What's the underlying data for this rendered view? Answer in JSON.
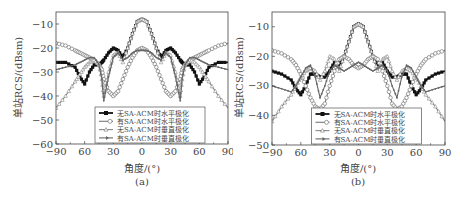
{
  "chart_data": [
    {
      "type": "line",
      "panel": "a",
      "caption": "(a)",
      "xlabel": "角度/(°)",
      "ylabel": "单站RCS/(dBsm)",
      "xlim": [
        -90,
        90
      ],
      "ylim": [
        -60,
        -5
      ],
      "xticks": [
        -90,
        -60,
        -30,
        0,
        30,
        60,
        90
      ],
      "xtick_labels": [
        "−90",
        "60",
        "30",
        "0",
        "30",
        "60",
        "90"
      ],
      "yticks": [
        -10,
        -20,
        -30,
        -40,
        -50,
        -60
      ],
      "ytick_labels": [
        "−10",
        "−20",
        "−30",
        "−40",
        "−50",
        "−60"
      ],
      "grid": false,
      "legend_position": "lower center",
      "x": [
        -90,
        -80,
        -70,
        -65,
        -60,
        -55,
        -50,
        -45,
        -42,
        -40,
        -35,
        -30,
        -25,
        -20,
        -15,
        -10,
        -5,
        0,
        5,
        10,
        15,
        20,
        25,
        30,
        35,
        40,
        42,
        45,
        50,
        55,
        60,
        65,
        70,
        80,
        90
      ],
      "series": [
        {
          "name": "无SA-ACM时水平极化",
          "marker": "filled-square",
          "color": "#111111",
          "values": [
            -26,
            -26,
            -28,
            -32,
            -35,
            -30,
            -27,
            -27,
            -26,
            -25,
            -22,
            -20,
            -21,
            -24,
            -20,
            -14,
            -9,
            -8,
            -9,
            -14,
            -20,
            -24,
            -21,
            -20,
            -22,
            -25,
            -26,
            -27,
            -27,
            -30,
            -35,
            -32,
            -28,
            -26,
            -26
          ]
        },
        {
          "name": "有SA-ACM时水平极化",
          "marker": "open-circle",
          "color": "#777777",
          "values": [
            -18,
            -19,
            -21,
            -22,
            -23,
            -24,
            -25,
            -27,
            -29,
            -33,
            -38,
            -40,
            -38,
            -33,
            -28,
            -24,
            -21,
            -20,
            -21,
            -24,
            -28,
            -33,
            -38,
            -40,
            -38,
            -33,
            -29,
            -27,
            -25,
            -24,
            -23,
            -22,
            -21,
            -19,
            -18
          ]
        },
        {
          "name": "无SA-ACM时垂直极化",
          "marker": "open-triangle",
          "color": "#888888",
          "values": [
            -45,
            -40,
            -34,
            -31,
            -28,
            -26,
            -25,
            -27,
            -33,
            -40,
            -30,
            -23,
            -22,
            -26,
            -20,
            -14,
            -9,
            -8,
            -9,
            -14,
            -20,
            -26,
            -22,
            -23,
            -30,
            -40,
            -33,
            -27,
            -25,
            -26,
            -28,
            -31,
            -34,
            -40,
            -45
          ]
        },
        {
          "name": "有SA-ACM时垂直极化",
          "marker": "line-arrow",
          "color": "#666666",
          "values": [
            -29,
            -28,
            -27,
            -26,
            -25,
            -24,
            -24,
            -27,
            -33,
            -42,
            -32,
            -24,
            -22,
            -25,
            -24,
            -22,
            -21,
            -21,
            -21,
            -22,
            -24,
            -25,
            -22,
            -24,
            -32,
            -42,
            -33,
            -27,
            -24,
            -24,
            -25,
            -26,
            -27,
            -28,
            -29
          ]
        }
      ]
    },
    {
      "type": "line",
      "panel": "b",
      "caption": "(b)",
      "xlabel": "角度/(°)",
      "ylabel": "单站RCS/(dBsm)",
      "xlim": [
        -90,
        90
      ],
      "ylim": [
        -50,
        -5
      ],
      "xticks": [
        -90,
        -60,
        -30,
        0,
        30,
        60,
        90
      ],
      "xtick_labels": [
        "−90",
        "60",
        "30",
        "0",
        "30",
        "60",
        "90"
      ],
      "yticks": [
        -10,
        -20,
        -30,
        -40,
        -50
      ],
      "ytick_labels": [
        "−10",
        "−20",
        "−30",
        "−40",
        "−50"
      ],
      "grid": false,
      "legend_position": "lower center",
      "x": [
        -90,
        -80,
        -70,
        -65,
        -60,
        -55,
        -50,
        -45,
        -40,
        -35,
        -30,
        -25,
        -20,
        -15,
        -10,
        -5,
        0,
        5,
        10,
        15,
        20,
        25,
        30,
        35,
        40,
        45,
        50,
        55,
        60,
        65,
        70,
        80,
        90
      ],
      "series": [
        {
          "name": "无SA-ACM时水平极化",
          "marker": "filled-square",
          "color": "#111111",
          "values": [
            -25,
            -26,
            -28,
            -31,
            -33,
            -30,
            -26,
            -26,
            -27,
            -27,
            -25,
            -22,
            -23,
            -20,
            -15,
            -10,
            -9,
            -10,
            -15,
            -20,
            -23,
            -22,
            -25,
            -27,
            -27,
            -26,
            -26,
            -30,
            -33,
            -31,
            -28,
            -26,
            -25
          ]
        },
        {
          "name": "有SA-ACM时水平极化",
          "marker": "open-circle",
          "color": "#777777",
          "values": [
            -18,
            -19,
            -21,
            -23,
            -26,
            -30,
            -34,
            -37,
            -38,
            -36,
            -30,
            -25,
            -21,
            -20,
            -21,
            -23,
            -24,
            -23,
            -21,
            -20,
            -21,
            -25,
            -30,
            -36,
            -38,
            -37,
            -34,
            -30,
            -26,
            -23,
            -21,
            -19,
            -18
          ]
        },
        {
          "name": "无SA-ACM时垂直极化",
          "marker": "open-triangle",
          "color": "#888888",
          "values": [
            -42,
            -37,
            -33,
            -30,
            -27,
            -25,
            -24,
            -25,
            -28,
            -25,
            -20,
            -21,
            -25,
            -20,
            -15,
            -10,
            -9,
            -10,
            -15,
            -20,
            -25,
            -21,
            -20,
            -25,
            -28,
            -25,
            -24,
            -25,
            -27,
            -30,
            -33,
            -37,
            -42
          ]
        },
        {
          "name": "有SA-ACM时垂直极化",
          "marker": "line-arrow",
          "color": "#666666",
          "values": [
            -30,
            -31,
            -32,
            -30,
            -27,
            -24,
            -23,
            -27,
            -34,
            -30,
            -25,
            -23,
            -24,
            -25,
            -24,
            -23,
            -22,
            -23,
            -24,
            -25,
            -24,
            -23,
            -25,
            -30,
            -34,
            -27,
            -23,
            -24,
            -27,
            -30,
            -32,
            -31,
            -30
          ]
        }
      ]
    }
  ]
}
